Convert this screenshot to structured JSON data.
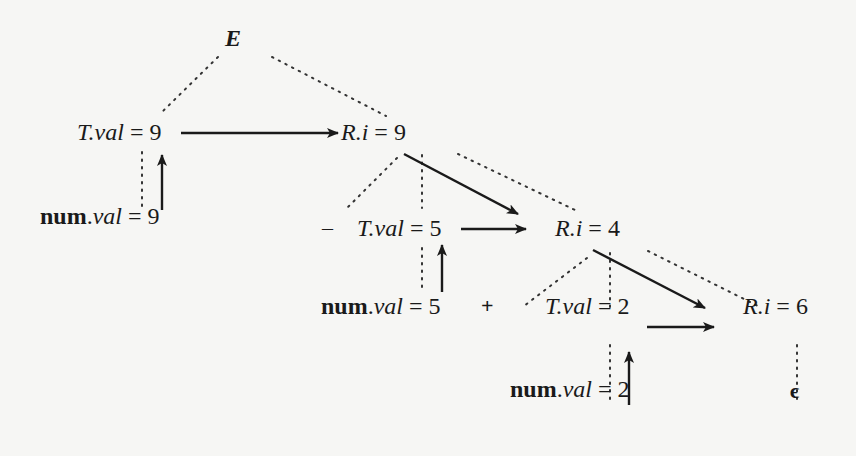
{
  "diagram": {
    "type": "annotated-parse-tree",
    "root": {
      "symbol": "E"
    },
    "nodes": [
      {
        "id": "T1",
        "symbol": "T",
        "attr": "val",
        "value": "9"
      },
      {
        "id": "R1",
        "symbol": "R",
        "attr": "i",
        "value": "9"
      },
      {
        "id": "num1",
        "symbol": "num",
        "attr": "val",
        "value": "9"
      },
      {
        "id": "T2",
        "symbol": "T",
        "attr": "val",
        "value": "5"
      },
      {
        "id": "R2",
        "symbol": "R",
        "attr": "i",
        "value": "4"
      },
      {
        "id": "num2",
        "symbol": "num",
        "attr": "val",
        "value": "5"
      },
      {
        "id": "T3",
        "symbol": "T",
        "attr": "val",
        "value": "2"
      },
      {
        "id": "R3",
        "symbol": "R",
        "attr": "i",
        "value": "6"
      },
      {
        "id": "num3",
        "symbol": "num",
        "attr": "val",
        "value": "2"
      }
    ],
    "operators": {
      "minus": "–",
      "plus": "+"
    },
    "epsilon": "ϵ",
    "equals": "=",
    "dot": ".",
    "tree_edges_style": "dotted",
    "dependency_edges_style": "solid-arrow",
    "dependency_edges": [
      {
        "from": "num1",
        "to": "T1"
      },
      {
        "from": "T1",
        "to": "R1"
      },
      {
        "from": "num2",
        "to": "T2"
      },
      {
        "from": "R1",
        "to": "R2"
      },
      {
        "from": "T2",
        "to": "R2"
      },
      {
        "from": "num3",
        "to": "T3"
      },
      {
        "from": "R2",
        "to": "R3"
      },
      {
        "from": "T3",
        "to": "R3"
      }
    ]
  }
}
